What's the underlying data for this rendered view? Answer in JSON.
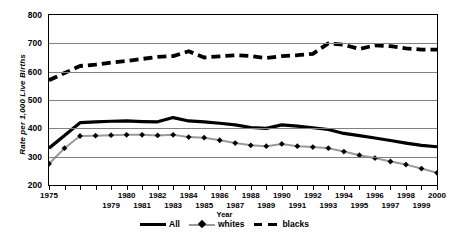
{
  "chart_data": {
    "type": "line",
    "title": "",
    "xlabel": "Year",
    "ylabel": "Rate per 1,000 Live Births",
    "xlim": [
      1975,
      2000
    ],
    "ylim": [
      200,
      800
    ],
    "ytick_values": [
      800,
      700,
      600,
      500,
      400,
      300,
      200
    ],
    "ytick_labels": [
      "800",
      "700",
      "600",
      "500",
      "400",
      "300",
      "200"
    ],
    "grid": true,
    "legend_position": "bottom",
    "x": [
      1975,
      1976,
      1977,
      1978,
      1979,
      1980,
      1981,
      1982,
      1983,
      1984,
      1985,
      1986,
      1987,
      1988,
      1989,
      1990,
      1991,
      1992,
      1993,
      1994,
      1995,
      1996,
      1997,
      1998,
      1999,
      2000
    ],
    "xtick_labels": [
      {
        "year": 1975,
        "label": "1975",
        "row": 0
      },
      {
        "year": 1979,
        "label": "1979",
        "row": 1
      },
      {
        "year": 1980,
        "label": "1980",
        "row": 0
      },
      {
        "year": 1981,
        "label": "1981",
        "row": 1
      },
      {
        "year": 1982,
        "label": "1982",
        "row": 0
      },
      {
        "year": 1983,
        "label": "1983",
        "row": 1
      },
      {
        "year": 1984,
        "label": "1984",
        "row": 0
      },
      {
        "year": 1985,
        "label": "1985",
        "row": 1
      },
      {
        "year": 1986,
        "label": "1986",
        "row": 0
      },
      {
        "year": 1987,
        "label": "1987",
        "row": 1
      },
      {
        "year": 1988,
        "label": "1988",
        "row": 0
      },
      {
        "year": 1989,
        "label": "1989",
        "row": 1
      },
      {
        "year": 1990,
        "label": "1990",
        "row": 0
      },
      {
        "year": 1991,
        "label": "1991",
        "row": 1
      },
      {
        "year": 1992,
        "label": "1992",
        "row": 0
      },
      {
        "year": 1993,
        "label": "1993",
        "row": 1
      },
      {
        "year": 1994,
        "label": "1994",
        "row": 0
      },
      {
        "year": 1995,
        "label": "1995",
        "row": 1
      },
      {
        "year": 1996,
        "label": "1996",
        "row": 0
      },
      {
        "year": 1997,
        "label": "1997",
        "row": 1
      },
      {
        "year": 1998,
        "label": "1998",
        "row": 0
      },
      {
        "year": 1999,
        "label": "1999",
        "row": 1
      },
      {
        "year": 2000,
        "label": "2000",
        "row": 0
      }
    ],
    "series": [
      {
        "name": "All",
        "style": "solid",
        "color": "#000000",
        "width": 3.2,
        "marker": "none",
        "values": [
          330,
          375,
          420,
          423,
          425,
          426,
          424,
          423,
          438,
          426,
          423,
          418,
          412,
          403,
          400,
          412,
          408,
          402,
          396,
          382,
          374,
          366,
          357,
          348,
          340,
          335
        ]
      },
      {
        "name": "whites",
        "style": "solid",
        "color": "#9a9a9a",
        "width": 2.0,
        "marker": "diamond",
        "marker_color": "#000000",
        "values": [
          275,
          330,
          373,
          374,
          376,
          377,
          377,
          375,
          377,
          369,
          367,
          358,
          348,
          340,
          337,
          345,
          337,
          334,
          330,
          318,
          305,
          295,
          283,
          272,
          258,
          243
        ]
      },
      {
        "name": "blacks",
        "style": "dashed",
        "color": "#000000",
        "width": 3.8,
        "marker": "none",
        "values": [
          570,
          595,
          620,
          625,
          632,
          638,
          645,
          652,
          655,
          672,
          650,
          654,
          658,
          655,
          648,
          655,
          658,
          663,
          700,
          695,
          680,
          693,
          690,
          682,
          678,
          678
        ]
      }
    ]
  }
}
